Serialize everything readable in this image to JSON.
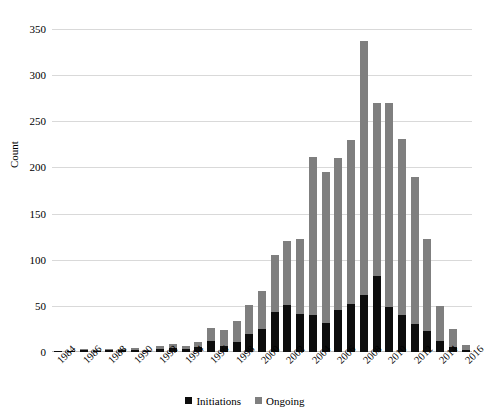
{
  "chart_data": {
    "type": "bar",
    "subtype": "stacked-vertical",
    "title": "",
    "xlabel": "",
    "ylabel": "Count",
    "ylim": [
      0,
      350
    ],
    "ytick_values": [
      0,
      50,
      100,
      150,
      200,
      250,
      300,
      350
    ],
    "ytick_labels": [
      "0",
      "50",
      "100",
      "150",
      "200",
      "250",
      "300",
      "350"
    ],
    "grid": "horizontal",
    "legend_position": "bottom-center",
    "xtick_labels": [
      "1984",
      "1986",
      "1988",
      "1990",
      "1992",
      "1994",
      "1996",
      "1998",
      "2000",
      "2002",
      "2004",
      "2006",
      "2008",
      "2010",
      "2012",
      "2014",
      "2016"
    ],
    "xtick_step": 2,
    "categories": [
      "1984",
      "1985",
      "1986",
      "1987",
      "1988",
      "1989",
      "1990",
      "1991",
      "1992",
      "1993",
      "1994",
      "1995",
      "1996",
      "1997",
      "1998",
      "1999",
      "2000",
      "2001",
      "2002",
      "2003",
      "2004",
      "2005",
      "2006",
      "2007",
      "2008",
      "2009",
      "2010",
      "2011",
      "2012",
      "2013",
      "2014",
      "2015",
      "2016"
    ],
    "series": [
      {
        "name": "Initiations",
        "color": "#0d0d0d",
        "values": [
          1,
          1,
          2,
          1,
          2,
          2,
          2,
          1,
          3,
          4,
          3,
          5,
          12,
          7,
          11,
          20,
          25,
          43,
          51,
          41,
          40,
          31,
          46,
          52,
          62,
          82,
          49,
          40,
          30,
          23,
          12,
          5,
          2
        ]
      },
      {
        "name": "Ongoing",
        "color": "#7f7f7f",
        "values": [
          0,
          0,
          1,
          1,
          1,
          1,
          2,
          1,
          4,
          5,
          4,
          6,
          14,
          17,
          23,
          31,
          41,
          62,
          69,
          81,
          171,
          164,
          164,
          178,
          275,
          188,
          221,
          191,
          160,
          100,
          38,
          20,
          6
        ]
      }
    ],
    "totals": [
      1,
      1,
      3,
      2,
      3,
      3,
      4,
      2,
      7,
      9,
      7,
      11,
      26,
      24,
      34,
      51,
      66,
      105,
      120,
      122,
      211,
      195,
      210,
      230,
      337,
      270,
      270,
      231,
      190,
      123,
      50,
      25,
      8
    ]
  },
  "legend": {
    "items": [
      {
        "label": "Initiations",
        "color": "#0d0d0d"
      },
      {
        "label": "Ongoing",
        "color": "#7f7f7f"
      }
    ]
  }
}
